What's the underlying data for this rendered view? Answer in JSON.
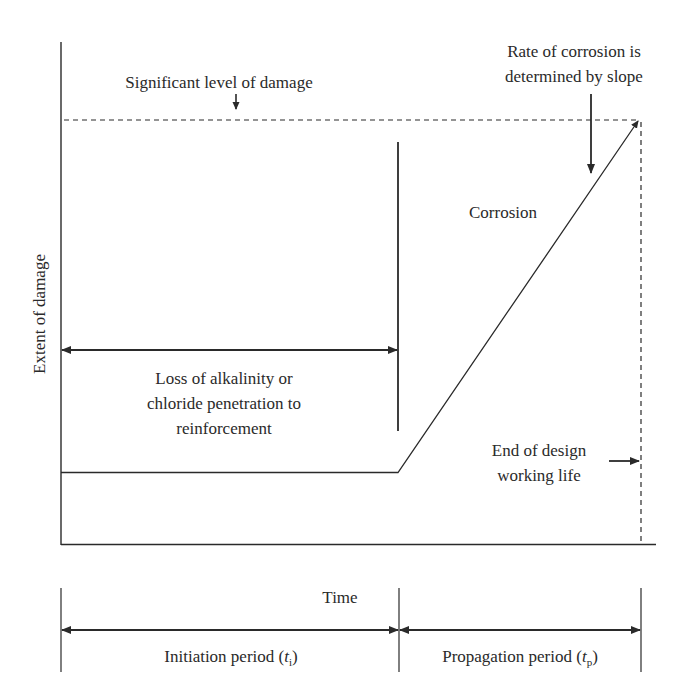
{
  "diagram": {
    "y_axis_label": "Extent of damage",
    "x_axis_label": "Time",
    "threshold_label": "Significant level of damage",
    "rate_label_line1": "Rate of corrosion is",
    "rate_label_line2": "determined by slope",
    "corrosion_label": "Corrosion",
    "initiation_desc_line1": "Loss of alkalinity or",
    "initiation_desc_line2": "chloride penetration to",
    "initiation_desc_line3": "reinforcement",
    "end_life_line1": "End of design",
    "end_life_line2": "working life",
    "initiation_period": {
      "text": "Initiation period (",
      "symbol": "t",
      "subscript": "i",
      "close": ")"
    },
    "propagation_period": {
      "text": "Propagation period (",
      "symbol": "t",
      "subscript": "p",
      "close": ")"
    },
    "colors": {
      "line": "#2a2a2a",
      "background": "#ffffff"
    }
  }
}
